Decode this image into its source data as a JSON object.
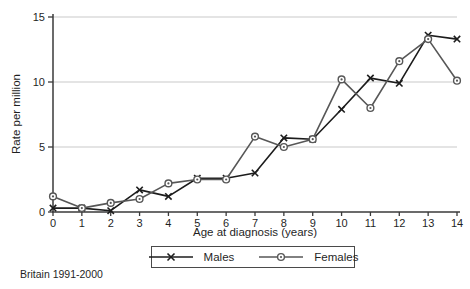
{
  "figure": {
    "source_caption": "Britain 1991-2000"
  },
  "chart_data": {
    "type": "line",
    "title": "",
    "xlabel": "Age at diagnosis (years)",
    "ylabel": "Rate per million",
    "x": [
      0,
      1,
      2,
      3,
      4,
      5,
      6,
      7,
      8,
      9,
      10,
      11,
      12,
      13,
      14
    ],
    "xlim": [
      0,
      14
    ],
    "ylim": [
      0,
      15
    ],
    "xticks": [
      0,
      1,
      2,
      3,
      4,
      5,
      6,
      7,
      8,
      9,
      10,
      11,
      12,
      13,
      14
    ],
    "yticks": [
      0,
      5,
      10,
      15
    ],
    "gridline_values": [
      5,
      10,
      15
    ],
    "grid": "horizontal-only",
    "legend_position": "bottom-center-boxed",
    "annotation": "Britain 1991-2000",
    "colors": {
      "grid": "#c9c9c9",
      "axis": "#3a3a3a",
      "text": "#1f1f1f",
      "background": "#ffffff"
    },
    "series": [
      {
        "name": "Males",
        "marker": "x-cross",
        "color": "#1c1c1c",
        "values": [
          0.3,
          0.3,
          0.1,
          1.7,
          1.2,
          2.6,
          2.6,
          3.0,
          5.7,
          5.6,
          7.9,
          10.3,
          9.9,
          13.6,
          13.3
        ]
      },
      {
        "name": "Females",
        "marker": "circle-dot",
        "color": "#575757",
        "values": [
          1.2,
          0.3,
          0.7,
          1.0,
          2.2,
          2.5,
          2.5,
          5.8,
          5.0,
          5.6,
          10.2,
          8.0,
          11.6,
          13.3,
          10.1
        ]
      }
    ]
  }
}
